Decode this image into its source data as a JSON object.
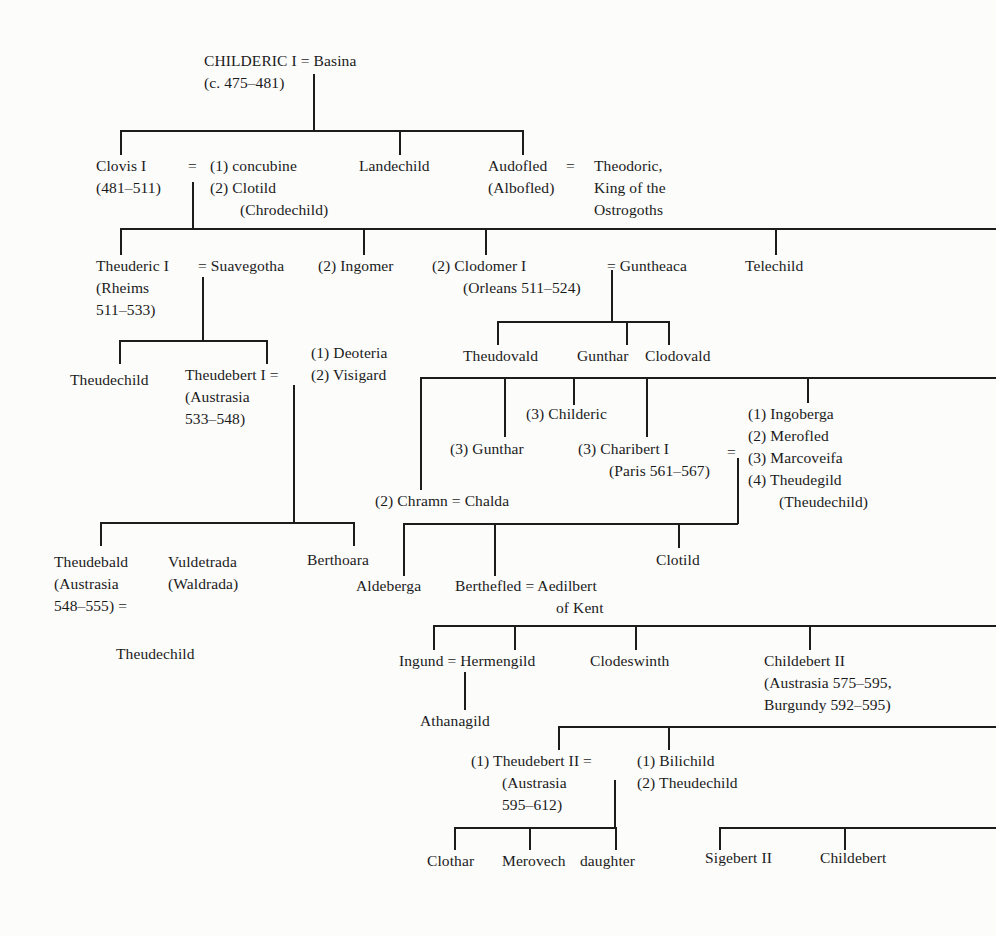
{
  "diagram": {
    "type": "genealogy-tree",
    "labels": {
      "childeric_1": "CHILDERIC I = Basina",
      "childeric_2": "(c. 475–481)",
      "clovis_1": "Clovis I",
      "clovis_2": "(481–511)",
      "clovis_eq": "=",
      "clovis_wife1": "(1) concubine",
      "clovis_wife2": "(2) Clotild",
      "clovis_wife3": "(Chrodechild)",
      "landechild": "Landechild",
      "audofled_1": "Audofled",
      "audofled_2": "(Albofled)",
      "audofled_eq": "=",
      "theodoric_1": "Theodoric,",
      "theodoric_2": "King of the",
      "theodoric_3": "Ostrogoths",
      "theuderic_1": "Theuderic I",
      "theuderic_eq": "= Suavegotha",
      "theuderic_2": "(Rheims",
      "theuderic_3": "511–533)",
      "ingomer": "(2) Ingomer",
      "clodomer_1": "(2) Clodomer I",
      "clodomer_eq": "= Guntheaca",
      "clodomer_2": "(Orleans 511–524)",
      "telechild": "Telechild",
      "theudovald": "Theudovald",
      "gunthar_a": "Gunthar",
      "clodovald": "Clodovald",
      "theudechild_a": "Theudechild",
      "theudebert1_1": "Theudebert I =",
      "theudebert1_2": "(Austrasia",
      "theudebert1_3": "533–548)",
      "deoteria": "(1) Deoteria",
      "visigard": "(2) Visigard",
      "childeric_3": "(3) Childeric",
      "gunthar_b": "(3) Gunthar",
      "charibert_1": "(3) Charibert I",
      "charibert_2": "(Paris 561–567)",
      "charibert_eq": "=",
      "ingoberga": "(1) Ingoberga",
      "merofled": "(2) Merofled",
      "marcoveifa": "(3) Marcoveifa",
      "theudegild": "(4) Theudegild",
      "theudegild_2": "(Theudechild)",
      "chramn": "(2) Chramn = Chalda",
      "theudebald_1": "Theudebald",
      "theudebald_2": "(Austrasia",
      "theudebald_3": "548–555) =",
      "vuldetrada_1": "Vuldetrada",
      "vuldetrada_2": "(Waldrada)",
      "berthoara": "Berthoara",
      "theudechild_b": "Theudechild",
      "aldeberga": "Aldeberga",
      "berthefled": "Berthefled = Aedilbert",
      "of_kent": "of Kent",
      "clotild_b": "Clotild",
      "ingund": "Ingund = Hermengild",
      "clodeswinth": "Clodeswinth",
      "childebert2_1": "Childebert II",
      "childebert2_2": "(Austrasia 575–595,",
      "childebert2_3": "Burgundy 592–595)",
      "athanagild": "Athanagild",
      "theudebert2_1": "(1) Theudebert II =",
      "theudebert2_2": "(Austrasia",
      "theudebert2_3": "595–612)",
      "bilichild": "(1) Bilichild",
      "theudechild_c": "(2) Theudechild",
      "clothar": "Clothar",
      "merovech": "Merovech",
      "daughter": "daughter",
      "sigebert2": "Sigebert II",
      "childebert_c": "Childebert"
    },
    "line_color": "#1c1c1c",
    "background": "#fcfcfa"
  }
}
